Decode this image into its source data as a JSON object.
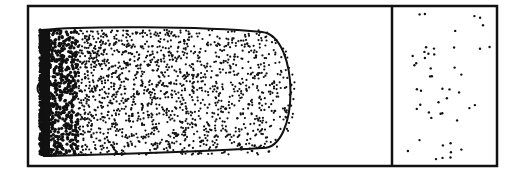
{
  "diagram": {
    "colors": {
      "ink": "#111111",
      "background": "#ffffff"
    },
    "outer_box": {
      "x": 28,
      "y": 6,
      "w": 469,
      "h": 160
    },
    "divider_x": 392,
    "gradient_region": {
      "left": 40,
      "top": 26,
      "bottom": 155,
      "right": 295,
      "density_max": 2600,
      "seed": 7
    },
    "right_compartment": {
      "dot_count": 48,
      "seed": 13
    }
  }
}
